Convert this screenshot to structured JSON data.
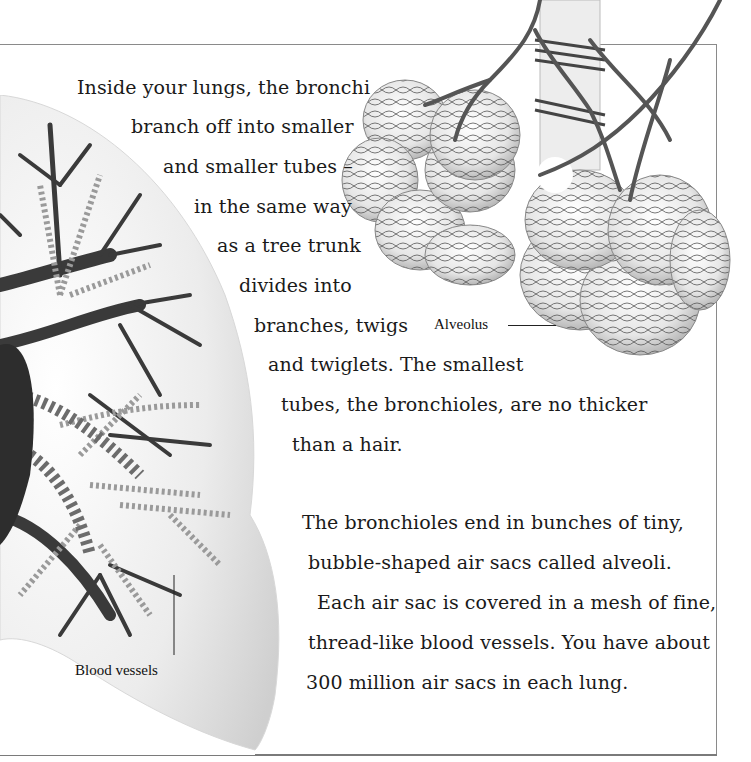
{
  "paragraph1": {
    "lines": [
      "Inside your lungs, the bronchi",
      "branch off into smaller",
      "and smaller tubes –",
      "in the same way",
      "as a tree trunk",
      "divides into",
      "branches, twigs",
      "and twiglets. The smallest",
      "tubes, the bronchioles, are no thicker",
      "than a hair."
    ]
  },
  "paragraph2": {
    "lines": [
      "The bronchioles end in bunches of tiny,",
      "bubble-shaped air sacs called alveoli.",
      "Each air sac is covered in a mesh of fine,",
      "thread-like blood vessels. You have about",
      "300 million air sacs in each lung."
    ]
  },
  "labels": {
    "alveolus": "Alveolus",
    "blood_vessels": "Blood vessels"
  },
  "illustrations": {
    "lung": "lung-bronchial-tree-illustration",
    "alveoli": "alveoli-cluster-illustration"
  },
  "colors": {
    "frame": "#8a8a8a",
    "text": "#1a1a1a"
  }
}
